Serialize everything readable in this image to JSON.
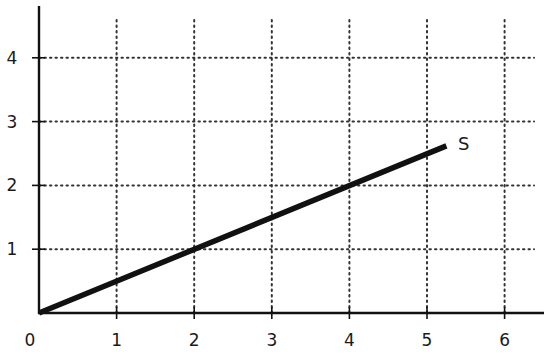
{
  "chart_data": {
    "type": "line",
    "title": "",
    "xlabel": "",
    "ylabel": "",
    "xlim": [
      0,
      6.5
    ],
    "ylim": [
      0,
      4.6
    ],
    "grid": true,
    "grid_style": "dotted",
    "legend": "none",
    "x_ticks": [
      1,
      2,
      3,
      4,
      5,
      6
    ],
    "x_tick_labels": [
      "1",
      "2",
      "3",
      "4",
      "5",
      "6"
    ],
    "y_ticks": [
      1,
      2,
      3,
      4
    ],
    "y_tick_labels": [
      "1",
      "2",
      "3",
      "4"
    ],
    "origin_label": "0",
    "series": [
      {
        "name": "S",
        "x": [
          0,
          5.25
        ],
        "y": [
          0,
          2.62
        ],
        "color": "#111111",
        "label_position": "end"
      }
    ],
    "annotations": [
      {
        "text": "S",
        "x": 5.4,
        "y": 2.65
      }
    ]
  }
}
